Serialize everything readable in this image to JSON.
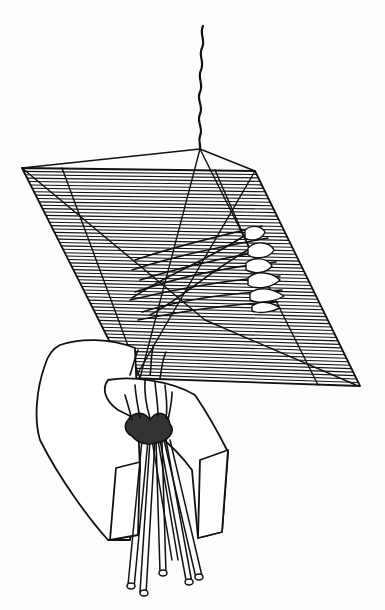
{
  "illustration": {
    "description": "Line drawing of a hanging sculpture: a parallelogram grid of horizontal threads suspended by a wavy cord, with feather/fish-like shapes woven across, above two angled blocks gripping a bundle of rods",
    "colors": {
      "ink": "#111111",
      "paper": "#fdfdfd"
    },
    "elements": [
      "hanging-cord",
      "grid-panel",
      "frame-struts",
      "woven-shapes",
      "left-block",
      "right-block",
      "rod-bundle"
    ]
  }
}
